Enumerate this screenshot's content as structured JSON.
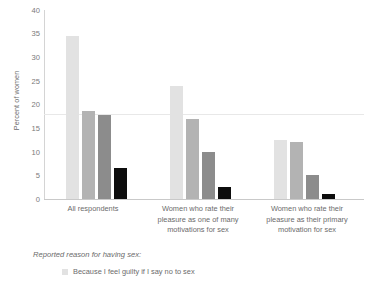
{
  "chart_data": {
    "type": "bar",
    "title": "",
    "xlabel": "",
    "ylabel": "Percent of women",
    "ylim": [
      0,
      40
    ],
    "ytick_step": 5,
    "yticks": [
      "40",
      "35",
      "30",
      "25",
      "20",
      "15",
      "10",
      "5",
      "0"
    ],
    "grid": false,
    "reference_line": 18,
    "legend_position": "bottom-left",
    "legend_title": "Reported reason for having sex:",
    "categories": [
      "All respondents",
      "Women who rate their pleasure as one of many motivations for sex",
      "Women who rate their pleasure as their primary motivation for sex"
    ],
    "series": [
      {
        "name": "Because I feel guilty if I say no to sex",
        "color": "#e2e2e2",
        "values": [
          34.5,
          24.0,
          12.5
        ]
      },
      {
        "name": "series-2",
        "color": "#b3b3b3",
        "values": [
          18.7,
          17.0,
          12.0
        ]
      },
      {
        "name": "series-3",
        "color": "#8c8c8c",
        "values": [
          17.8,
          10.0,
          5.0
        ]
      },
      {
        "name": "series-4",
        "color": "#0d0d0d",
        "values": [
          6.5,
          2.5,
          1.0
        ]
      }
    ]
  },
  "axis": {
    "y_title": "Percent of women",
    "tick_40": "40",
    "tick_35": "35",
    "tick_30": "30",
    "tick_25": "25",
    "tick_20": "20",
    "tick_15": "15",
    "tick_10": "10",
    "tick_5": "5",
    "tick_0": "0"
  },
  "categories": {
    "c1_line1": "All respondents",
    "c2_line1": "Women who rate their",
    "c2_line2": "pleasure as one of many",
    "c2_line3": "motivations for sex",
    "c3_line1": "Women who rate their",
    "c3_line2": "pleasure as their primary",
    "c3_line3": "motivation for sex"
  },
  "legend": {
    "title": "Reported reason for having sex:",
    "item1": "Because I feel guilty if I say no to sex"
  }
}
